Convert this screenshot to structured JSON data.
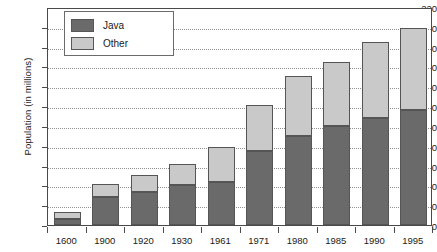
{
  "chart_data": {
    "type": "bar",
    "stacked": true,
    "title": "",
    "xlabel": "",
    "ylabel": "Population (in millions)",
    "ylim": [
      0,
      220
    ],
    "ytick_step": 20,
    "yticks": [
      0,
      20,
      40,
      60,
      80,
      100,
      120,
      140,
      160,
      180,
      200,
      220
    ],
    "grid": true,
    "grid_axis": "y",
    "legend_position": "top-left",
    "categories": [
      "1600",
      "1900",
      "1920",
      "1930",
      "1961",
      "1971",
      "1980",
      "1985",
      "1990",
      "1995"
    ],
    "series": [
      {
        "name": "Java",
        "color": "#6a6a6a",
        "values": [
          6,
          28,
          33,
          40,
          43,
          75,
          90,
          100,
          108,
          116
        ]
      },
      {
        "name": "Other",
        "color": "#c9c9c9",
        "values": [
          7,
          13,
          17,
          22,
          36,
          46,
          60,
          65,
          77,
          83
        ]
      }
    ],
    "totals": [
      13,
      41,
      50,
      62,
      79,
      121,
      150,
      165,
      185,
      199
    ]
  },
  "legend": {
    "items": [
      {
        "label": "Java",
        "swatch": "java-swatch"
      },
      {
        "label": "Other",
        "swatch": "other-swatch"
      }
    ]
  },
  "axes": {
    "y_title": "Population (in millions)"
  }
}
